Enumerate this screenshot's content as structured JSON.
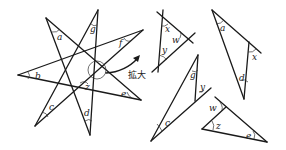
{
  "figure": {
    "star": {
      "angle_labels": [
        "a",
        "b",
        "c",
        "d",
        "e",
        "f",
        "g",
        "z"
      ]
    },
    "callout": {
      "label": "拡大"
    },
    "pieces": [
      {
        "name": "triangle-xyw",
        "labels": [
          "x",
          "w",
          "y"
        ]
      },
      {
        "name": "triangle-adx",
        "labels": [
          "a",
          "x",
          "d"
        ]
      },
      {
        "name": "triangle-gyc",
        "labels": [
          "g",
          "y",
          "c"
        ]
      },
      {
        "name": "triangle-wze",
        "labels": [
          "w",
          "z",
          "e"
        ]
      }
    ]
  },
  "labels": {
    "a": "a",
    "b": "b",
    "c": "c",
    "d": "d",
    "e": "e",
    "f": "f",
    "g": "g",
    "z": "z",
    "x": "x",
    "y": "y",
    "w": "w",
    "zoom": "拡大"
  }
}
